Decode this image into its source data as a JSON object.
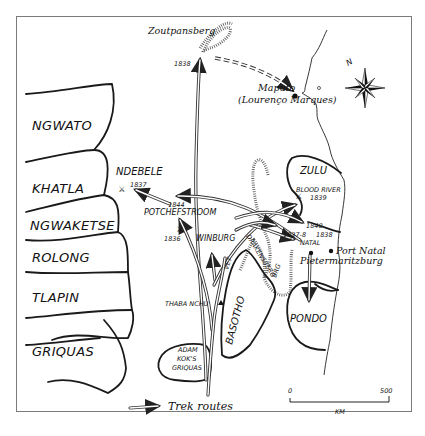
{
  "map": {
    "title": "Great Trek routes map",
    "tribal_regions_west": [
      {
        "label": "NGWATO"
      },
      {
        "label": "KHATLA"
      },
      {
        "label": "NGWAKETSE"
      },
      {
        "label": "ROLONG"
      },
      {
        "label": "TLAPIN"
      },
      {
        "label": "GRIQUAS"
      }
    ],
    "regions": {
      "zulu": "ZULU",
      "pondo": "PONDO",
      "basotho": "BASOTHO",
      "adam_kok_line1": "ADAM",
      "adam_kok_line2": "KOK'S",
      "adam_kok_line3": "GRIQUAS",
      "ndebele": "NDEBELE"
    },
    "places": {
      "zoutpansberg": "Zoutpansberg",
      "zoutpansberg_year": "1838",
      "maputo": "Maputo",
      "lourenco_marques": "(Lourenço Marques)",
      "ndebele_battle_year": "1837",
      "potchefstroom_year": "1844",
      "potchefstroom": "POTCHEFSTROOM",
      "winburg_battle_year": "1836",
      "winburg": "WINBURG",
      "thaba_nchu": "THABA NCHU",
      "blood_river": "BLOOD RIVER",
      "blood_river_year": "1839",
      "natal_year_1840": "1840",
      "natal_battle_years": "1837-8",
      "natal_battle_year2": "1838",
      "natal": "NATAL",
      "port_natal": "Port Natal",
      "pietermaritzburg": "Pietermaritzburg"
    },
    "rivers": {
      "vet": "VET",
      "drakensberg": "DRAKENSBERG",
      "berg_suffix": "BRG"
    },
    "compass": {
      "north_label": "N"
    },
    "scale_bar": {
      "start": "0",
      "end": "500",
      "unit": "KM"
    },
    "legend": {
      "trek_routes": "Trek routes"
    }
  }
}
